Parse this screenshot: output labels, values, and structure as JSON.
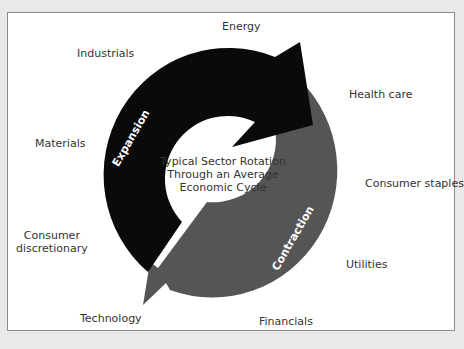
{
  "diagram": {
    "title_lines": [
      "Typical Sector Rotation",
      "Through an Average",
      "Economic Cycle"
    ],
    "phases": {
      "expansion": {
        "label": "Expansion",
        "color": "#0a0a0a"
      },
      "contraction": {
        "label": "Contraction",
        "color": "#555555"
      }
    },
    "sectors": [
      {
        "id": "energy",
        "label": "Energy"
      },
      {
        "id": "industrials",
        "label": "Industrials"
      },
      {
        "id": "health-care",
        "label": "Health care"
      },
      {
        "id": "materials",
        "label": "Materials"
      },
      {
        "id": "consumer-staples",
        "label": "Consumer staples"
      },
      {
        "id": "consumer-discretionary",
        "label": "Consumer discretionary",
        "lines": [
          "Consumer",
          "discretionary"
        ]
      },
      {
        "id": "utilities",
        "label": "Utilities"
      },
      {
        "id": "technology",
        "label": "Technology"
      },
      {
        "id": "financials",
        "label": "Financials"
      }
    ]
  }
}
